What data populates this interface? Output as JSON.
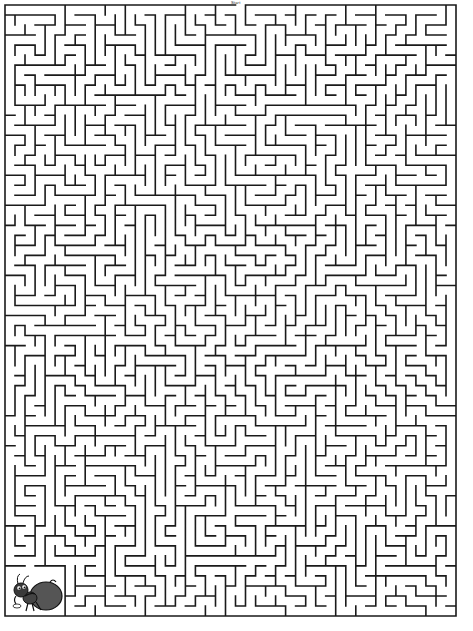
{
  "puzzle": {
    "type": "maze",
    "start_label": "Start",
    "start_position": "top-center",
    "finish_position": "bottom-left",
    "finish_character": "ant carrying a sack",
    "board": {
      "left": 5,
      "top": 5,
      "width": 451,
      "height": 611,
      "cols": 45,
      "rows": 61,
      "wall_color": "#1a1a1a",
      "background": "#ffffff",
      "wall_width": 1.6,
      "seed": 20240611
    },
    "entrance": {
      "col": 23,
      "side": "top"
    },
    "finish_zone": {
      "col": 0,
      "row": 56,
      "cols": 6,
      "rows": 5
    }
  }
}
